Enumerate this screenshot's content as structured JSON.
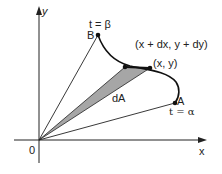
{
  "diagram": {
    "axes": {
      "x_label": "x",
      "y_label": "y",
      "origin_label": "0"
    },
    "points": {
      "B": {
        "label": "B",
        "param_label": "t = β"
      },
      "A": {
        "label": "A",
        "param_label": "t = α"
      },
      "P": {
        "label": "(x, y)"
      },
      "Q": {
        "label": "(x + dx, y + dy)"
      }
    },
    "region": {
      "label": "dA"
    },
    "colors": {
      "line": "#222222",
      "shade": "#a6a6a6",
      "background": "#ffffff"
    }
  }
}
